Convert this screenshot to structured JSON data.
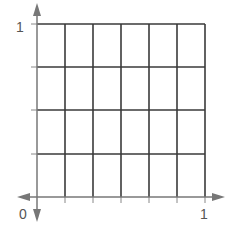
{
  "diagram": {
    "type": "unit-square-grid",
    "columns": 6,
    "rows": 4,
    "origin_label": "0",
    "x_axis_end_label": "1",
    "y_axis_end_label": "1",
    "colors": {
      "grid": "#3a3a3a",
      "axis": "#777777",
      "labels": "#555555",
      "background": "#ffffff"
    }
  }
}
